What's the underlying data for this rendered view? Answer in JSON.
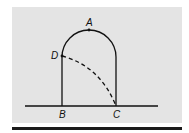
{
  "diagram": {
    "labels": {
      "A": "A",
      "B": "B",
      "C": "C",
      "D": "D"
    },
    "colors": {
      "background": "#e4e4e4",
      "stroke": "#111111"
    }
  }
}
